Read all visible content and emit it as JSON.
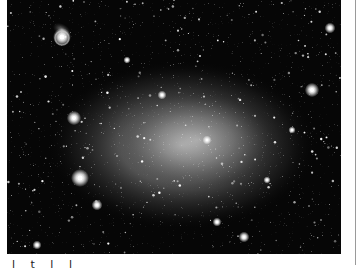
{
  "photo": {
    "subject": "dwarf galaxy star field",
    "background_color": "#060606",
    "glow": {
      "cx": 175,
      "cy": 145,
      "rx": 130,
      "ry": 80,
      "color": "#bdbdbd"
    },
    "bright_stars": [
      {
        "x": 55,
        "y": 37,
        "r": 5
      },
      {
        "x": 305,
        "y": 90,
        "r": 4
      },
      {
        "x": 67,
        "y": 118,
        "r": 4
      },
      {
        "x": 73,
        "y": 178,
        "r": 5
      },
      {
        "x": 323,
        "y": 28,
        "r": 3
      },
      {
        "x": 237,
        "y": 237,
        "r": 3
      },
      {
        "x": 90,
        "y": 205,
        "r": 3
      },
      {
        "x": 210,
        "y": 222,
        "r": 2.5
      },
      {
        "x": 155,
        "y": 95,
        "r": 2.5
      },
      {
        "x": 200,
        "y": 140,
        "r": 2.5
      },
      {
        "x": 30,
        "y": 245,
        "r": 2.5
      },
      {
        "x": 260,
        "y": 180,
        "r": 2
      },
      {
        "x": 120,
        "y": 60,
        "r": 2
      },
      {
        "x": 285,
        "y": 130,
        "r": 2
      }
    ]
  },
  "caption": {
    "text": "l t l l"
  }
}
